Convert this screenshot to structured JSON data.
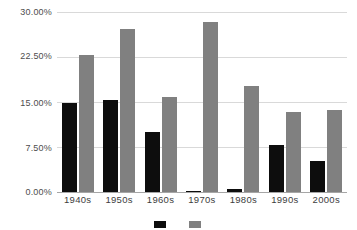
{
  "chart_data": {
    "type": "bar",
    "title": "",
    "subtitle": "",
    "xlabel": "",
    "ylabel": "",
    "categories": [
      "1940s",
      "1950s",
      "1960s",
      "1970s",
      "1980s",
      "1990s",
      "2000s"
    ],
    "series": [
      {
        "name": "",
        "color": "#0d0d0d",
        "values": [
          14.9,
          15.3,
          10.0,
          0.2,
          0.5,
          7.8,
          5.1
        ]
      },
      {
        "name": "",
        "color": "#808080",
        "values": [
          22.8,
          27.2,
          15.8,
          28.4,
          17.6,
          13.3,
          13.6
        ]
      }
    ],
    "ylim": [
      0,
      30
    ],
    "yticks": [
      0,
      7.5,
      15,
      22.5,
      30
    ],
    "ytick_labels": [
      "0.00%",
      "7.50%",
      "15.00%",
      "22.50%",
      "30.00%"
    ],
    "grid": true,
    "legend_position": "bottom",
    "legend_clipped": true
  },
  "axis": {
    "y_labels": [
      "30.00%",
      "22.50%",
      "15.00%",
      "7.50%",
      "0.00%"
    ],
    "x_labels": [
      "1940s",
      "1950s",
      "1960s",
      "1970s",
      "1980s",
      "1990s",
      "2000s"
    ]
  },
  "legend": {
    "items": [
      {
        "label": "",
        "color": "#0d0d0d"
      },
      {
        "label": "",
        "color": "#808080"
      }
    ]
  },
  "colors": {
    "series_1": "#0d0d0d",
    "series_2": "#808080",
    "gridline": "#d9d9d9",
    "axis_line": "#a6a6a6",
    "background": "#ffffff",
    "tick_text": "#4d4d4d"
  }
}
